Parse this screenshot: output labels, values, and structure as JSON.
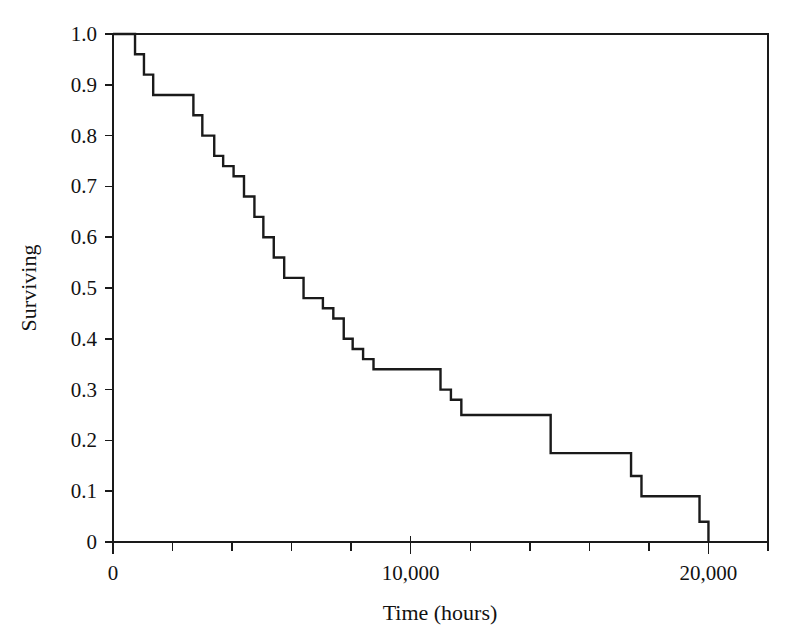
{
  "figure": {
    "background_color": "#ffffff",
    "line_color": "#1a1a1a",
    "text_color": "#121212"
  },
  "axes": {
    "x_title": "Time (hours)",
    "y_title": "Surviving",
    "x_major_ticks": [
      "0",
      "10,000",
      "20,000"
    ],
    "y_ticks": [
      "0",
      "0.1",
      "0.2",
      "0.3",
      "0.4",
      "0.5",
      "0.6",
      "0.7",
      "0.8",
      "0.9",
      "1.0"
    ]
  },
  "chart_data": {
    "type": "line",
    "title": "",
    "subtitle": "",
    "xlabel": "Time (hours)",
    "ylabel": "Surviving",
    "xlim": [
      0,
      22000
    ],
    "ylim": [
      0,
      1.0
    ],
    "grid": false,
    "legend": null,
    "annotations": [],
    "x_major_tick_values": [
      0,
      10000,
      20000
    ],
    "x_major_tick_labels": [
      "0",
      "10,000",
      "20,000"
    ],
    "x_minor_tick_values": [
      2000,
      4000,
      6000,
      8000,
      12000,
      14000,
      16000,
      18000,
      22000
    ],
    "y_tick_values": [
      0,
      0.1,
      0.2,
      0.3,
      0.4,
      0.5,
      0.6,
      0.7,
      0.8,
      0.9,
      1.0
    ],
    "y_tick_labels": [
      "0",
      "0.1",
      "0.2",
      "0.3",
      "0.4",
      "0.5",
      "0.6",
      "0.7",
      "0.8",
      "0.9",
      "1.0"
    ],
    "series": [
      {
        "name": "Kaplan-Meier survival",
        "step_type": "post",
        "x": [
          0,
          740,
          740,
          1040,
          1040,
          1350,
          1350,
          2700,
          2700,
          3000,
          3000,
          3400,
          3400,
          3700,
          3700,
          4050,
          4050,
          4400,
          4400,
          4750,
          4750,
          5050,
          5050,
          5400,
          5400,
          5750,
          5750,
          6050,
          6050,
          6400,
          6400,
          7050,
          7050,
          7400,
          7400,
          7750,
          7750,
          8050,
          8050,
          8400,
          8400,
          8750,
          8750,
          11000,
          11000,
          11350,
          11350,
          11700,
          11700,
          14700,
          14700,
          17400,
          17400,
          17750,
          17750,
          19700,
          19700,
          20000,
          20000
        ],
        "y": [
          1.0,
          1.0,
          0.96,
          0.96,
          0.92,
          0.92,
          0.88,
          0.88,
          0.84,
          0.84,
          0.8,
          0.8,
          0.76,
          0.76,
          0.74,
          0.74,
          0.72,
          0.72,
          0.68,
          0.68,
          0.64,
          0.64,
          0.6,
          0.6,
          0.56,
          0.56,
          0.52,
          0.52,
          0.52,
          0.52,
          0.48,
          0.48,
          0.46,
          0.46,
          0.44,
          0.44,
          0.4,
          0.4,
          0.38,
          0.38,
          0.36,
          0.36,
          0.34,
          0.34,
          0.3,
          0.3,
          0.28,
          0.28,
          0.25,
          0.25,
          0.175,
          0.175,
          0.13,
          0.13,
          0.09,
          0.09,
          0.04,
          0.04,
          0.0
        ],
        "points": [
          {
            "t": 0,
            "s": 1.0
          },
          {
            "t": 740,
            "s": 0.96
          },
          {
            "t": 1040,
            "s": 0.92
          },
          {
            "t": 1350,
            "s": 0.88
          },
          {
            "t": 2700,
            "s": 0.84
          },
          {
            "t": 3000,
            "s": 0.8
          },
          {
            "t": 3400,
            "s": 0.76
          },
          {
            "t": 3700,
            "s": 0.74
          },
          {
            "t": 4050,
            "s": 0.72
          },
          {
            "t": 4400,
            "s": 0.68
          },
          {
            "t": 4750,
            "s": 0.64
          },
          {
            "t": 5050,
            "s": 0.6
          },
          {
            "t": 5400,
            "s": 0.56
          },
          {
            "t": 5750,
            "s": 0.52
          },
          {
            "t": 6400,
            "s": 0.48
          },
          {
            "t": 7050,
            "s": 0.46
          },
          {
            "t": 7400,
            "s": 0.44
          },
          {
            "t": 7750,
            "s": 0.4
          },
          {
            "t": 8050,
            "s": 0.38
          },
          {
            "t": 8400,
            "s": 0.36
          },
          {
            "t": 8750,
            "s": 0.34
          },
          {
            "t": 11000,
            "s": 0.3
          },
          {
            "t": 11350,
            "s": 0.28
          },
          {
            "t": 11700,
            "s": 0.25
          },
          {
            "t": 14700,
            "s": 0.175
          },
          {
            "t": 17400,
            "s": 0.13
          },
          {
            "t": 17750,
            "s": 0.09
          },
          {
            "t": 19700,
            "s": 0.04
          },
          {
            "t": 20000,
            "s": 0.0
          }
        ]
      }
    ]
  }
}
